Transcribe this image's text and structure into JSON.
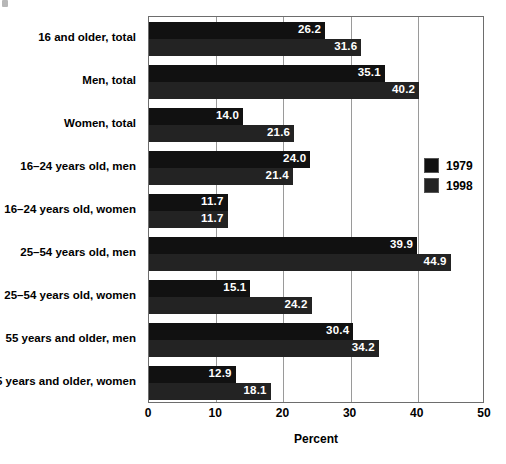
{
  "chart_data": {
    "type": "bar",
    "orientation": "horizontal",
    "title": "",
    "xlabel": "Percent",
    "ylabel": "",
    "xlim": [
      0,
      50
    ],
    "xticks": [
      "0",
      "10",
      "20",
      "30",
      "40",
      "50"
    ],
    "grid": true,
    "legend_position": "right-inside",
    "categories": [
      "16 and older, total",
      "Men, total",
      "Women, total",
      "16–24 years old, men",
      "16–24 years old, women",
      "25–54 years old, men",
      "25–54 years old, women",
      "55 years and older, men",
      "55 years and older, women"
    ],
    "series": [
      {
        "name": "1979",
        "color": "#111111",
        "values": [
          26.2,
          35.1,
          14.0,
          24.0,
          11.7,
          39.9,
          15.1,
          30.4,
          12.9
        ],
        "labels": [
          "26.2",
          "35.1",
          "14.0",
          "24.0",
          "11.7",
          "39.9",
          "15.1",
          "30.4",
          "12.9"
        ]
      },
      {
        "name": "1998",
        "color": "#232323",
        "values": [
          31.6,
          40.2,
          21.6,
          21.4,
          11.7,
          44.9,
          24.2,
          34.2,
          18.1
        ],
        "labels": [
          "31.6",
          "40.2",
          "21.6",
          "21.4",
          "11.7",
          "44.9",
          "24.2",
          "34.2",
          "18.1"
        ]
      }
    ]
  },
  "legend": {
    "items": [
      {
        "label": "1979",
        "color": "#111111"
      },
      {
        "label": "1998",
        "color": "#232323"
      }
    ]
  },
  "axis": {
    "x_title": "Percent",
    "x_tick_labels": [
      "0",
      "10",
      "20",
      "30",
      "40",
      "50"
    ]
  }
}
